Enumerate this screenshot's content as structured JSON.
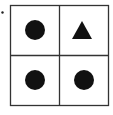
{
  "diagram": {
    "type": "2x2 grid of shapes",
    "colors": {
      "stroke": "#333333",
      "fill": "#111111",
      "background": "#ffffff"
    },
    "bullet": {
      "shape": "dot"
    },
    "cells": [
      {
        "row": 0,
        "col": 0,
        "shape": "circle"
      },
      {
        "row": 0,
        "col": 1,
        "shape": "triangle"
      },
      {
        "row": 1,
        "col": 0,
        "shape": "circle"
      },
      {
        "row": 1,
        "col": 1,
        "shape": "circle"
      }
    ]
  }
}
